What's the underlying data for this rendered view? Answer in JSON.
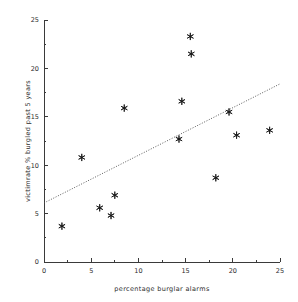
{
  "chart_data": {
    "type": "scatter",
    "title": "",
    "xlabel": "percentage burglar alarms",
    "ylabel": "victimrate % burgled past 5 years",
    "xlim": [
      0,
      25
    ],
    "ylim": [
      0,
      25
    ],
    "xticks": [
      0,
      5,
      10,
      15,
      20,
      25
    ],
    "yticks": [
      0,
      5,
      10,
      15,
      20,
      25
    ],
    "xtick_labels": [
      "0",
      "5",
      "10",
      "15",
      "20",
      "25"
    ],
    "ytick_labels": [
      "0",
      "5",
      "10",
      "15",
      "20",
      "25"
    ],
    "minor_ticks": true,
    "grid": false,
    "legend": null,
    "marker_style": "asterisk",
    "points": [
      {
        "x": 1.9,
        "y": 3.7
      },
      {
        "x": 4.0,
        "y": 10.8
      },
      {
        "x": 5.9,
        "y": 5.6
      },
      {
        "x": 7.1,
        "y": 4.8
      },
      {
        "x": 7.5,
        "y": 6.9
      },
      {
        "x": 8.5,
        "y": 15.9
      },
      {
        "x": 14.3,
        "y": 12.7
      },
      {
        "x": 14.6,
        "y": 16.6
      },
      {
        "x": 15.5,
        "y": 23.3
      },
      {
        "x": 15.6,
        "y": 21.5
      },
      {
        "x": 18.2,
        "y": 8.7
      },
      {
        "x": 19.6,
        "y": 15.5
      },
      {
        "x": 20.4,
        "y": 13.1
      },
      {
        "x": 23.9,
        "y": 13.6
      }
    ],
    "trend_line": {
      "style": "dotted",
      "x_start": 0,
      "y_start": 6.1,
      "x_end": 25,
      "y_end": 18.4
    }
  },
  "colors": {
    "background": "#ffffff",
    "axis": "#3a3a3a",
    "marker": "#1a1a1a",
    "trend": "#4a4a4a",
    "text": "#2b2b2b"
  }
}
